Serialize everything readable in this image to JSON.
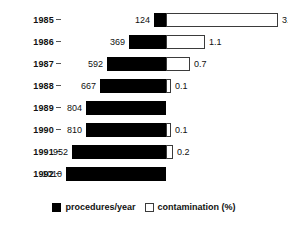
{
  "chart_data": {
    "type": "bar",
    "title": "",
    "subtitle": "",
    "xlabel": "",
    "ylabel": "",
    "orientation": "horizontal",
    "style": "diverging-bidirectional",
    "grid": false,
    "legend_position": "bottom-center",
    "categories": [
      "1985",
      "1986",
      "1987",
      "1988",
      "1989",
      "1990",
      "1991",
      "1992"
    ],
    "series": [
      {
        "name": "procedures/year",
        "color": "#000000",
        "direction": "left",
        "unit": "procedures",
        "values": [
          124,
          369,
          592,
          667,
          804,
          810,
          952,
          1010
        ],
        "axis_max": 1010
      },
      {
        "name": "contamination (%)",
        "color": "#ffffff",
        "direction": "right",
        "unit": "%",
        "values": [
          3.2,
          1.1,
          0.7,
          0.1,
          null,
          0.1,
          0.2,
          null
        ],
        "axis_max": 3.2
      }
    ],
    "rows": [
      {
        "year": "1985",
        "procedures": "124",
        "procedures_value": 124,
        "contamination": "3.2",
        "contamination_value": 3.2
      },
      {
        "year": "1986",
        "procedures": "369",
        "procedures_value": 369,
        "contamination": "1.1",
        "contamination_value": 1.1
      },
      {
        "year": "1987",
        "procedures": "592",
        "procedures_value": 592,
        "contamination": "0.7",
        "contamination_value": 0.7
      },
      {
        "year": "1988",
        "procedures": "667",
        "procedures_value": 667,
        "contamination": "0.1",
        "contamination_value": 0.1
      },
      {
        "year": "1989",
        "procedures": "804",
        "procedures_value": 804,
        "contamination": "",
        "contamination_value": null
      },
      {
        "year": "1990",
        "procedures": "810",
        "procedures_value": 810,
        "contamination": "0.1",
        "contamination_value": 0.1
      },
      {
        "year": "1991",
        "procedures": "952",
        "procedures_value": 952,
        "contamination": "0.2",
        "contamination_value": 0.2
      },
      {
        "year": "1992",
        "procedures": "1010",
        "procedures_value": 1010,
        "contamination": "",
        "contamination_value": null
      }
    ]
  },
  "legend": {
    "items": [
      {
        "label": "procedures/year",
        "swatch": "filled-square-icon"
      },
      {
        "label": "contamination (%)",
        "swatch": "hollow-square-icon"
      }
    ]
  },
  "colors": {
    "procedures": "#000000",
    "contamination_fill": "#ffffff",
    "contamination_stroke": "#3b3b3b",
    "text": "#111111",
    "background": "#ffffff"
  }
}
